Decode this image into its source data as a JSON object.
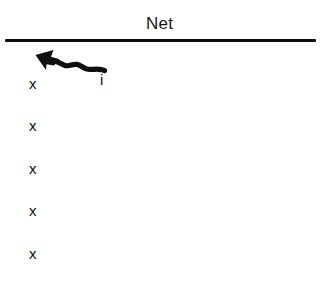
{
  "figure": {
    "background_color": "#ffffff",
    "ink_color": "#101010",
    "net": {
      "label": "Net",
      "line_color": "#0d0d0d"
    },
    "arrow": {
      "icon": "zigzag-arrow-icon",
      "direction": "up-left",
      "style": "wavy",
      "color": "#101010",
      "source_label": "i",
      "target_label": "x"
    },
    "x_column": {
      "count": 5,
      "marks": [
        {
          "label": "x"
        },
        {
          "label": "x"
        },
        {
          "label": "x"
        },
        {
          "label": "x"
        },
        {
          "label": "x"
        }
      ]
    }
  }
}
